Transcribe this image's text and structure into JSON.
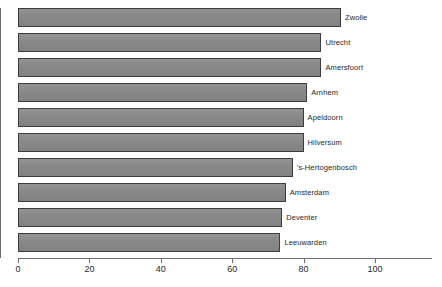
{
  "chart_data": {
    "type": "bar",
    "orientation": "horizontal",
    "title": "",
    "subtitle": "",
    "xlabel": "",
    "ylabel": "",
    "xlim": [
      0,
      115
    ],
    "ylim": null,
    "grid": false,
    "legend": null,
    "legend_position": "none",
    "xticks": [
      0,
      20,
      40,
      60,
      80,
      100
    ],
    "xtick_labels": [
      "0",
      "20",
      "40",
      "60",
      "80",
      "100"
    ],
    "categories": [
      "Zwolle",
      "Utrecht",
      "Amersfoort",
      "Arnhem",
      "Apeldoorn",
      "Hilversum",
      "'s-Hertogenbosch",
      "Amsterdam",
      "Deventer",
      "Leeuwarden"
    ],
    "values": [
      90.5,
      85,
      85,
      81,
      80,
      80,
      77,
      75,
      74,
      73.5
    ],
    "bars": [
      {
        "label": "Zwolle",
        "value": 90.5
      },
      {
        "label": "Utrecht",
        "value": 85
      },
      {
        "label": "Amersfoort",
        "value": 85
      },
      {
        "label": "Arnhem",
        "value": 81
      },
      {
        "label": "Apeldoorn",
        "value": 80
      },
      {
        "label": "Hilversum",
        "value": 80
      },
      {
        "label": "'s-Hertogenbosch",
        "value": 77
      },
      {
        "label": "Amsterdam",
        "value": 75
      },
      {
        "label": "Deventer",
        "value": 74
      },
      {
        "label": "Leeuwarden",
        "value": 73.5
      }
    ]
  },
  "style": {
    "bar_fill": "#8a8a8a",
    "bar_border": "#3d3d3d",
    "axis_color": "#6e6e6e",
    "text_color": "#1f1f1f",
    "background": "#ffffff"
  }
}
